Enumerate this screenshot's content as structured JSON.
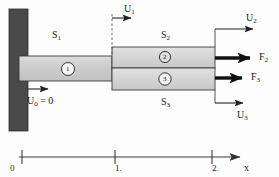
{
  "figure": {
    "type": "engineering-diagram",
    "colors": {
      "wall_fill": "#4a4a4a",
      "bar_fill": "#c9c9c9",
      "bar_fill_light": "#d8d8d8",
      "outline": "#2a2a2a",
      "background": "#fdfdfd"
    }
  },
  "members": {
    "s1_label": "S",
    "s1_sub": "1",
    "s2_label": "S",
    "s2_sub": "2",
    "s3_label": "S",
    "s3_sub": "3"
  },
  "elements": [
    {
      "id": "element-1",
      "number": "1"
    },
    {
      "id": "element-2",
      "number": "2"
    },
    {
      "id": "element-3",
      "number": "3"
    }
  ],
  "displacements": [
    {
      "id": "u0",
      "label": "U",
      "sub": "0",
      "suffix": " = 0",
      "kind": "boundary-condition"
    },
    {
      "id": "u1",
      "label": "U",
      "sub": "1",
      "suffix": "",
      "kind": "displacement"
    },
    {
      "id": "u2",
      "label": "U",
      "sub": "2",
      "suffix": "",
      "kind": "displacement"
    },
    {
      "id": "u3",
      "label": "U",
      "sub": "3",
      "suffix": "",
      "kind": "displacement"
    }
  ],
  "forces": [
    {
      "id": "f2",
      "label": "F",
      "sub": "2",
      "kind": "applied-force"
    },
    {
      "id": "f3",
      "label": "F",
      "sub": "3",
      "kind": "applied-force"
    }
  ],
  "axis": {
    "name": "x",
    "ticks": [
      {
        "value": "0",
        "position": 0
      },
      {
        "value": "1.",
        "position": 1
      },
      {
        "value": "2.",
        "position": 2
      }
    ]
  }
}
